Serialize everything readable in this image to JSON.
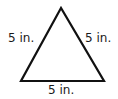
{
  "figure": {
    "shape": "equilateral triangle",
    "stroke_color": "#111111",
    "labels": {
      "left": "5 in.",
      "right": "5 in.",
      "bottom": "5 in."
    }
  }
}
